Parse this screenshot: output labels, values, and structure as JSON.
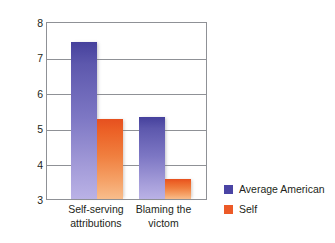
{
  "chart_data": {
    "type": "bar",
    "title": "",
    "subtitle": "",
    "xlabel": "",
    "ylabel": "Perceived susceptibility",
    "ylim": [
      3,
      8
    ],
    "y_ticks": [
      "8",
      "7",
      "6",
      "5",
      "4",
      "3"
    ],
    "y_tick_values": [
      8,
      7,
      6,
      5,
      4,
      3
    ],
    "gridlines": [
      7,
      6,
      5,
      4
    ],
    "grid": true,
    "legend_position": "right-bottom",
    "categories": [
      "Self-serving attributions",
      "Blaming the victom"
    ],
    "category_lines": [
      [
        "Self-serving",
        "attributions"
      ],
      [
        "Blaming the",
        "victom"
      ]
    ],
    "series": [
      {
        "name": "Average American",
        "color": "#4a44a4",
        "values": [
          7.4,
          5.3
        ]
      },
      {
        "name": "Self",
        "color": "#ec5a28",
        "values": [
          5.25,
          3.55
        ]
      }
    ]
  },
  "legend": {
    "items": [
      {
        "label": "Average American",
        "color": "#4a44a4"
      },
      {
        "label": "Self",
        "color": "#ec5a28"
      }
    ]
  },
  "axes": {
    "y_title": "Perceived susceptibility",
    "y_tick_8": "8",
    "y_tick_7": "7",
    "y_tick_6": "6",
    "y_tick_5": "5",
    "y_tick_4": "4",
    "y_tick_3": "3"
  },
  "x_axis": {
    "cat1_line1": "Self-serving",
    "cat1_line2": "attributions",
    "cat2_line1": "Blaming the",
    "cat2_line2": "victom"
  },
  "colors": {
    "blue_top": "#45409c",
    "blue_bottom": "#bab2e6",
    "orange_top": "#e6501f",
    "orange_bottom": "#f8bd8c",
    "axis": "#8f9196",
    "text": "#231f20",
    "background": "#ffffff"
  }
}
